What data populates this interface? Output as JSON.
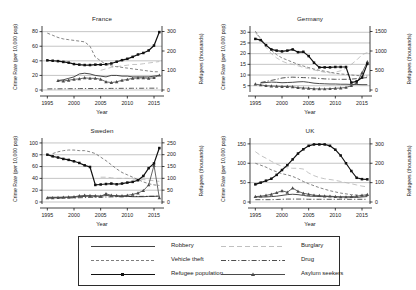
{
  "figure": {
    "shared_xlabel": "Year",
    "shared_ylabel_left": "Crime Rate (per 10,000 pop)",
    "shared_ylabel_right": "Refugees (thousands)",
    "x_ticks": [
      "1995",
      "2000",
      "2005",
      "2010",
      "2015"
    ]
  },
  "legend": {
    "entries": [
      {
        "label": "Robbery",
        "style": "solid",
        "marker": "none",
        "color": "#2b2b2b"
      },
      {
        "label": "Burglary",
        "style": "longdash",
        "marker": "none",
        "color": "#b9b9b9"
      },
      {
        "label": "Vehicle theft",
        "style": "dashed",
        "marker": "none",
        "color": "#6f6f6f"
      },
      {
        "label": "Drug",
        "style": "dashdot",
        "marker": "none",
        "color": "#3a3a3a"
      },
      {
        "label": "Refugee population",
        "style": "solid",
        "marker": "square",
        "color": "#111111"
      },
      {
        "label": "Asylum seekers",
        "style": "solid",
        "marker": "triangle",
        "color": "#4a4a4a"
      }
    ]
  },
  "chart_data": [
    {
      "type": "line",
      "title": "France",
      "xlabel": "Year",
      "ylabel": "Crime Rate (per 10,000 pop)",
      "ylabel_right": "Refugees (thousands)",
      "grid": true,
      "legend_position": "below-figure",
      "xlim": [
        1994,
        2016.5
      ],
      "ylim": [
        0,
        85
      ],
      "ylim_right": [
        0,
        318
      ],
      "yticks": [
        0,
        20,
        40,
        60,
        80
      ],
      "yticks_right": [
        0,
        100,
        200,
        300
      ],
      "x": [
        1995,
        1996,
        1997,
        1998,
        1999,
        2000,
        2001,
        2002,
        2003,
        2004,
        2005,
        2006,
        2007,
        2008,
        2009,
        2010,
        2011,
        2012,
        2013,
        2014,
        2015,
        2016
      ],
      "series": [
        {
          "name": "Refugee population",
          "axis": "right",
          "units": "thousands",
          "values": [
            152,
            150,
            148,
            144,
            140,
            133,
            130,
            128,
            128,
            130,
            130,
            132,
            136,
            145,
            153,
            160,
            170,
            182,
            190,
            203,
            228,
            297
          ]
        },
        {
          "name": "Asylum seekers",
          "axis": "right",
          "units": "thousands",
          "values": [
            null,
            null,
            48,
            46,
            50,
            55,
            57,
            62,
            60,
            60,
            55,
            42,
            38,
            42,
            50,
            54,
            60,
            62,
            62,
            60,
            63,
            76
          ]
        },
        {
          "name": "Robbery",
          "axis": "left",
          "values": [
            null,
            null,
            13,
            14,
            16,
            18,
            22,
            23,
            22,
            20,
            19,
            18,
            20,
            20,
            19,
            19,
            18,
            18,
            18,
            18,
            19,
            20
          ]
        },
        {
          "name": "Vehicle theft",
          "axis": "left",
          "values": [
            78,
            75,
            72,
            70,
            69,
            68,
            67,
            66,
            60,
            45,
            40,
            35,
            33,
            32,
            31,
            30,
            29,
            28,
            27,
            26,
            25,
            25
          ]
        },
        {
          "name": "Burglary",
          "axis": "left",
          "values": [
            null,
            null,
            null,
            null,
            null,
            null,
            null,
            null,
            null,
            null,
            27,
            29,
            31,
            32,
            33,
            34,
            35,
            35,
            36,
            37,
            38,
            39
          ]
        },
        {
          "name": "Drug",
          "axis": "left",
          "values": [
            1.5,
            1.6,
            1.6,
            1.7,
            1.8,
            1.8,
            1.9,
            2.0,
            2.0,
            2.0,
            2.1,
            2.1,
            2.2,
            2.2,
            2.3,
            2.3,
            2.4,
            2.4,
            2.4,
            2.5,
            2.5,
            2.6
          ]
        }
      ]
    },
    {
      "type": "line",
      "title": "Germany",
      "xlabel": "Year",
      "ylabel": "Crime Rate (per 10,000 pop)",
      "ylabel_right": "Refugees (thousands)",
      "grid": true,
      "legend_position": "below-figure",
      "xlim": [
        1994,
        2016.5
      ],
      "ylim": [
        3,
        32
      ],
      "ylim_right": [
        0,
        1590
      ],
      "yticks": [
        5,
        10,
        15,
        20,
        25,
        30
      ],
      "yticks_right": [
        0,
        500,
        1000,
        1500
      ],
      "x": [
        1995,
        1996,
        1997,
        1998,
        1999,
        2000,
        2001,
        2002,
        2003,
        2004,
        2005,
        2006,
        2007,
        2008,
        2009,
        2010,
        2011,
        2012,
        2013,
        2014,
        2015,
        2016
      ],
      "series": [
        {
          "name": "Refugee population",
          "axis": "right",
          "units": "thousands",
          "values": [
            1310,
            1280,
            1150,
            1040,
            1010,
            990,
            1010,
            1040,
            970,
            980,
            870,
            700,
            580,
            580,
            580,
            590,
            590,
            590,
            190,
            220,
            320,
            670
          ]
        },
        {
          "name": "Asylum seekers",
          "axis": "right",
          "units": "thousands",
          "values": [
            150,
            130,
            110,
            100,
            95,
            90,
            90,
            80,
            60,
            50,
            45,
            30,
            28,
            27,
            33,
            45,
            50,
            65,
            110,
            175,
            440,
            720
          ]
        },
        {
          "name": "Robbery",
          "axis": "left",
          "values": [
            null,
            6.3,
            6.5,
            6.7,
            6.6,
            6.4,
            6.5,
            6.6,
            6.8,
            6.9,
            6.6,
            6.2,
            6.0,
            5.9,
            5.8,
            5.8,
            5.7,
            5.7,
            5.6,
            5.6,
            5.5,
            5.5
          ]
        },
        {
          "name": "Vehicle theft",
          "axis": "left",
          "values": [
            30.5,
            27.0,
            24.0,
            21.5,
            19.5,
            18.0,
            17.0,
            16.0,
            15.0,
            14.2,
            13.5,
            12.8,
            12.2,
            11.8,
            11.3,
            10.8,
            10.5,
            10.3,
            10.0,
            9.8,
            9.6,
            9.5
          ]
        },
        {
          "name": "Burglary",
          "axis": "left",
          "values": [
            30.0,
            26.5,
            23.0,
            20.0,
            18.0,
            16.5,
            15.5,
            15.0,
            14.3,
            13.6,
            13.0,
            12.4,
            11.8,
            11.3,
            11.0,
            11.3,
            12.0,
            13.2,
            15.0,
            17.0,
            19.5,
            20.5
          ]
        },
        {
          "name": "Drug",
          "axis": "left",
          "values": [
            null,
            6.5,
            7.0,
            7.5,
            8.0,
            8.6,
            8.9,
            9.0,
            8.9,
            8.8,
            8.7,
            8.6,
            8.4,
            8.2,
            8.1,
            8.0,
            8.0,
            8.0,
            8.1,
            8.3,
            8.6,
            8.8
          ]
        }
      ]
    },
    {
      "type": "line",
      "title": "Sweden",
      "xlabel": "Year",
      "ylabel": "Crime Rate (per 10,000 pop)",
      "ylabel_right": "Refugees (thousands)",
      "grid": true,
      "legend_position": "below-figure",
      "xlim": [
        1994,
        2016.5
      ],
      "ylim": [
        0,
        105
      ],
      "ylim_right": [
        0,
        262
      ],
      "yticks": [
        0,
        20,
        40,
        60,
        80,
        100
      ],
      "yticks_right": [
        0,
        50,
        100,
        150,
        200,
        250
      ],
      "x": [
        1995,
        1996,
        1997,
        1998,
        1999,
        2000,
        2001,
        2002,
        2003,
        2004,
        2005,
        2006,
        2007,
        2008,
        2009,
        2010,
        2011,
        2012,
        2013,
        2014,
        2015,
        2016
      ],
      "series": [
        {
          "name": "Refugee population",
          "axis": "right",
          "units": "thousands",
          "values": [
            200,
            193,
            188,
            182,
            178,
            172,
            165,
            155,
            148,
            72,
            74,
            76,
            78,
            75,
            78,
            82,
            85,
            92,
            110,
            143,
            163,
            228
          ]
        },
        {
          "name": "Asylum seekers",
          "axis": "right",
          "units": "thousands",
          "values": [
            18,
            18,
            19,
            20,
            21,
            22,
            26,
            28,
            27,
            26,
            24,
            35,
            28,
            27,
            26,
            28,
            32,
            38,
            48,
            72,
            155,
            18
          ]
        },
        {
          "name": "Robbery",
          "axis": "left",
          "values": [
            8,
            8,
            8,
            8,
            8,
            8.5,
            9,
            9.5,
            10,
            10,
            10,
            11,
            10.5,
            10,
            9.5,
            9.5,
            9,
            9,
            9,
            9.5,
            9.5,
            10
          ]
        },
        {
          "name": "Vehicle theft",
          "axis": "left",
          "values": [
            null,
            82,
            85,
            87,
            88,
            88,
            87,
            87,
            85,
            82,
            76,
            70,
            63,
            56,
            50,
            46,
            42,
            38,
            34,
            31,
            29,
            28
          ]
        },
        {
          "name": "Burglary",
          "axis": "left",
          "values": [
            null,
            null,
            null,
            null,
            null,
            null,
            null,
            null,
            null,
            null,
            42,
            42,
            41,
            40,
            40,
            40,
            39,
            38,
            38,
            37,
            36,
            35
          ]
        },
        {
          "name": "Drug",
          "axis": "left",
          "values": [
            6.5,
            6.5,
            6.6,
            6.6,
            6.8,
            7.0,
            7.2,
            7.5,
            7.8,
            8.0,
            8.2,
            8.5,
            8.6,
            8.8,
            9.0,
            9.2,
            9.4,
            9.5,
            9.6,
            9.7,
            9.8,
            10.0
          ]
        }
      ]
    },
    {
      "type": "line",
      "title": "UK",
      "xlabel": "Year",
      "ylabel": "Crime Rate (per 10,000 pop)",
      "ylabel_right": "Refugees (thousands)",
      "grid": true,
      "legend_position": "below-figure",
      "xlim": [
        1994,
        2016.5
      ],
      "ylim": [
        0,
        160
      ],
      "ylim_right": [
        0,
        320
      ],
      "yticks": [
        0,
        50,
        100,
        150
      ],
      "yticks_right": [
        0,
        100,
        200,
        300
      ],
      "x": [
        1995,
        1996,
        1997,
        1998,
        1999,
        2000,
        2001,
        2002,
        2003,
        2004,
        2005,
        2006,
        2007,
        2008,
        2009,
        2010,
        2011,
        2012,
        2013,
        2014,
        2015,
        2016
      ],
      "series": [
        {
          "name": "Refugee population",
          "axis": "right",
          "units": "thousands",
          "values": [
            91,
            100,
            110,
            120,
            140,
            165,
            190,
            220,
            250,
            272,
            290,
            297,
            297,
            297,
            290,
            270,
            240,
            200,
            160,
            125,
            118,
            117
          ]
        },
        {
          "name": "Asylum seekers",
          "axis": "right",
          "units": "thousands",
          "values": [
            28,
            30,
            34,
            40,
            48,
            58,
            50,
            72,
            55,
            45,
            40,
            35,
            33,
            31,
            30,
            28,
            26,
            26,
            28,
            30,
            34,
            38
          ]
        },
        {
          "name": "Robbery",
          "axis": "left",
          "values": [
            13,
            13,
            13,
            14,
            15,
            17,
            19,
            20,
            19,
            17,
            15,
            15,
            14,
            14,
            14,
            13,
            13,
            13,
            12,
            12,
            13,
            14
          ]
        },
        {
          "name": "Vehicle theft",
          "axis": "left",
          "values": [
            100,
            95,
            90,
            83,
            78,
            73,
            70,
            66,
            60,
            53,
            47,
            42,
            37,
            33,
            29,
            26,
            23,
            21,
            19,
            18,
            17,
            16
          ]
        },
        {
          "name": "Burglary",
          "axis": "left",
          "values": [
            130,
            120,
            113,
            105,
            98,
            92,
            88,
            87,
            87,
            85,
            75,
            68,
            63,
            60,
            58,
            56,
            53,
            50,
            47,
            44,
            41,
            39
          ]
        },
        {
          "name": "Drug",
          "axis": "left",
          "values": [
            6,
            6,
            6,
            6,
            6.5,
            7,
            7.5,
            7.5,
            7.5,
            7.5,
            7,
            7,
            7,
            7,
            7,
            7,
            7,
            7,
            7,
            7,
            7,
            7
          ]
        }
      ]
    }
  ]
}
